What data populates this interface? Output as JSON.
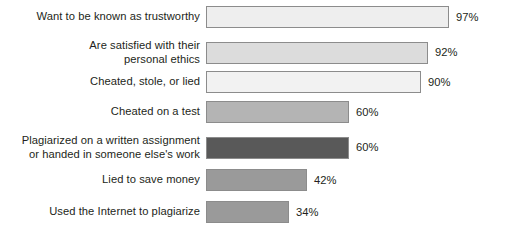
{
  "chart_data": {
    "type": "bar",
    "orientation": "horizontal",
    "title": "",
    "subtitle": "",
    "xlabel": "",
    "ylabel": "",
    "xlim": [
      0,
      100
    ],
    "grid": false,
    "legend": null,
    "value_suffix": "%",
    "categories": [
      "Want to be known as trustworthy",
      "Are satisfied with their\npersonal ethics",
      "Cheated, stole, or lied",
      "Cheated on a test",
      "Plagiarized on a written assignment\nor handed in someone else's work",
      "Lied to save money",
      "Used the Internet to plagiarize"
    ],
    "values": [
      97,
      92,
      90,
      60,
      60,
      42,
      34
    ],
    "value_labels": [
      "97%",
      "92%",
      "90%",
      "60%",
      "60%",
      "42%",
      "34%"
    ],
    "bar_colors": [
      "#eeeeee",
      "#dcdcdc",
      "#f2f2f2",
      "#b4b4b4",
      "#595959",
      "#9a9a9a",
      "#9a9a9a"
    ],
    "bar_border_color": "#8c8c8c",
    "background_color": "#ffffff",
    "text_color": "#231f20"
  },
  "rows": [
    {
      "label": "Want to be known as trustworthy",
      "value_label": "97%",
      "value": 97,
      "color": "#eeeeee",
      "bar_width_px": 243,
      "top_px": 6,
      "height_px": 22
    },
    {
      "label": "Are satisfied with their\npersonal ethics",
      "value_label": "92%",
      "value": 92,
      "color": "#dcdcdc",
      "bar_width_px": 222,
      "top_px": 39,
      "height_px": 22
    },
    {
      "label": "Cheated, stole, or lied",
      "value_label": "90%",
      "value": 90,
      "color": "#f2f2f2",
      "bar_width_px": 215,
      "top_px": 71,
      "height_px": 22
    },
    {
      "label": "Cheated on a test",
      "value_label": "60%",
      "value": 60,
      "color": "#b4b4b4",
      "bar_width_px": 143,
      "top_px": 101,
      "height_px": 22
    },
    {
      "label": "Plagiarized on a written assignment\nor handed in someone else's work",
      "value_label": "60%",
      "value": 60,
      "color": "#595959",
      "bar_width_px": 143,
      "top_px": 134,
      "height_px": 22
    },
    {
      "label": "Lied to save money",
      "value_label": "42%",
      "value": 42,
      "color": "#9a9a9a",
      "bar_width_px": 101,
      "top_px": 169,
      "height_px": 22
    },
    {
      "label": "Used the Internet to plagiarize",
      "value_label": "34%",
      "value": 34,
      "color": "#9a9a9a",
      "bar_width_px": 83,
      "top_px": 201,
      "height_px": 22
    }
  ]
}
